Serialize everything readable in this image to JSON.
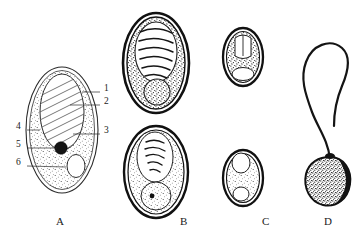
{
  "figure": {
    "kind": "scientific-specimen-plate",
    "background_color": "#ffffff",
    "ink_color": "#1a1a1a",
    "panel_count": 4
  },
  "panels": [
    {
      "letter": "A",
      "name": "labeled-schematic-ovum",
      "letter_x": 60,
      "letter_y": 224,
      "description": "line-drawing oval ovum with stippled cytoplasm, hatched inner body, dark granule and clear vacuole"
    },
    {
      "letter": "B",
      "name": "stippled-ova-pair",
      "letter_x": 183,
      "letter_y": 224,
      "description": "two large dark-shelled ova with coiled internal mass"
    },
    {
      "letter": "C",
      "name": "small-ova-pair",
      "letter_x": 265,
      "letter_y": 224,
      "description": "two small dark-shelled ova"
    },
    {
      "letter": "D",
      "name": "flagellated-form",
      "letter_x": 327,
      "letter_y": 224,
      "description": "stippled pyriform body with long looping flagellum"
    }
  ],
  "leader_labels": [
    {
      "number": "1",
      "side": "right",
      "text_x": 104,
      "text_y": 89,
      "line_from_x": 82,
      "line_from_y": 92,
      "line_to_x": 100,
      "line_to_y": 92
    },
    {
      "number": "2",
      "side": "right",
      "text_x": 104,
      "text_y": 102,
      "line_from_x": 70,
      "line_from_y": 105,
      "line_to_x": 100,
      "line_to_y": 105
    },
    {
      "number": "3",
      "side": "right",
      "text_x": 104,
      "text_y": 131,
      "line_from_x": 73,
      "line_from_y": 134,
      "line_to_x": 100,
      "line_to_y": 134
    },
    {
      "number": "4",
      "side": "left",
      "text_x": 16,
      "text_y": 127,
      "line_from_x": 27,
      "line_from_y": 130,
      "line_to_x": 40,
      "line_to_y": 130
    },
    {
      "number": "5",
      "side": "left",
      "text_x": 16,
      "text_y": 145,
      "line_from_x": 27,
      "line_from_y": 148,
      "line_to_x": 57,
      "line_to_y": 148
    },
    {
      "number": "6",
      "side": "left",
      "text_x": 16,
      "text_y": 163,
      "line_from_x": 27,
      "line_from_y": 166,
      "line_to_x": 66,
      "line_to_y": 167
    }
  ]
}
